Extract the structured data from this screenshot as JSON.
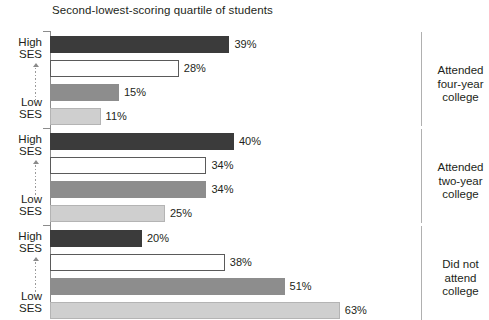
{
  "chart_data": {
    "type": "bar",
    "orientation": "horizontal",
    "title": "Second-lowest-scoring quartile of students",
    "xlabel": "",
    "ylabel": "",
    "xlim": [
      0,
      70
    ],
    "grid": false,
    "legend_position": "none",
    "value_suffix": "%",
    "axis_top_label": "High\nSES",
    "axis_bottom_label": "Low\nSES",
    "series": [
      {
        "name": "High SES",
        "shade": "dark",
        "color": "#3b3b3b",
        "values": [
          39,
          40,
          20
        ]
      },
      {
        "name": "Second quartile SES",
        "shade": "white",
        "color": "#ffffff",
        "values": [
          28,
          34,
          38
        ]
      },
      {
        "name": "Third quartile SES",
        "shade": "medium-gray",
        "color": "#8d8d8d",
        "values": [
          15,
          34,
          51
        ]
      },
      {
        "name": "Low SES",
        "shade": "light-gray",
        "color": "#cfcfcf",
        "values": [
          11,
          25,
          63
        ]
      }
    ],
    "categories": [
      "Attended four-year college",
      "Attended two-year college",
      "Did not attend college"
    ],
    "groups": [
      {
        "category_lines": [
          "Attended",
          "four-year",
          "college"
        ],
        "ses_top": [
          "High",
          "SES"
        ],
        "ses_bottom": [
          "Low",
          "SES"
        ],
        "bars": [
          {
            "series": "High SES",
            "value": 39,
            "label": "39%"
          },
          {
            "series": "Second quartile SES",
            "value": 28,
            "label": "28%"
          },
          {
            "series": "Third quartile SES",
            "value": 15,
            "label": "15%"
          },
          {
            "series": "Low SES",
            "value": 11,
            "label": "11%"
          }
        ]
      },
      {
        "category_lines": [
          "Attended",
          "two-year",
          "college"
        ],
        "ses_top": [
          "High",
          "SES"
        ],
        "ses_bottom": [
          "Low",
          "SES"
        ],
        "bars": [
          {
            "series": "High SES",
            "value": 40,
            "label": "40%"
          },
          {
            "series": "Second quartile SES",
            "value": 34,
            "label": "34%"
          },
          {
            "series": "Third quartile SES",
            "value": 34,
            "label": "34%"
          },
          {
            "series": "Low SES",
            "value": 25,
            "label": "25%"
          }
        ]
      },
      {
        "category_lines": [
          "Did not",
          "attend",
          "college"
        ],
        "ses_top": [
          "High",
          "SES"
        ],
        "ses_bottom": [
          "Low",
          "SES"
        ],
        "bars": [
          {
            "series": "High SES",
            "value": 20,
            "label": "20%"
          },
          {
            "series": "Second quartile SES",
            "value": 38,
            "label": "38%"
          },
          {
            "series": "Third quartile SES",
            "value": 51,
            "label": "51%"
          },
          {
            "series": "Low SES",
            "value": 63,
            "label": "63%"
          }
        ]
      }
    ]
  },
  "colors": {
    "axis": "#8c8c8c",
    "text": "#231f20",
    "rule": "#b0b0b0"
  }
}
